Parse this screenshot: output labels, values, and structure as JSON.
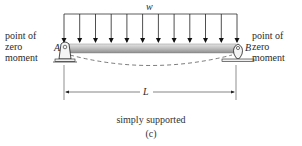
{
  "diagram": {
    "load_label": "w",
    "support_left_label": "A",
    "support_right_label": "B",
    "left_annotation": [
      "point of",
      "zero",
      "moment"
    ],
    "right_annotation": [
      "point of",
      "zero",
      "moment"
    ],
    "span_label": "L",
    "caption": "simply supported",
    "subfigure": "(c)",
    "arrow_count": 12,
    "colors": {
      "beam_top": "#d8d8d8",
      "beam_bottom": "#9a9a9a",
      "line": "#222222"
    }
  }
}
